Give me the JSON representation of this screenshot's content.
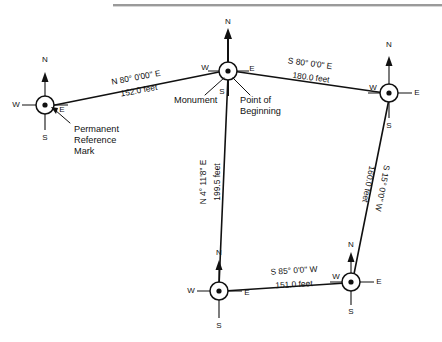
{
  "diagram": {
    "top_rule_color": "#9a9a9a",
    "line_color": "#111111",
    "background": "#ffffff"
  },
  "compass_labels": {
    "north": "N",
    "south": "S",
    "east": "E",
    "west": "W"
  },
  "stations": [
    {
      "id": "prm",
      "name": "permanent-reference-mark",
      "x": 45,
      "y": 105,
      "n": "N",
      "s": "S",
      "e": "E",
      "w": "W"
    },
    {
      "id": "pob",
      "name": "point-of-beginning-monument",
      "x": 228,
      "y": 71,
      "n": "N",
      "s": "S",
      "e": "E",
      "w": "W"
    },
    {
      "id": "ne",
      "name": "northeast-corner",
      "x": 389,
      "y": 93,
      "n": "N",
      "s": "S",
      "e": "E",
      "w": "W"
    },
    {
      "id": "se",
      "name": "southeast-corner",
      "x": 351,
      "y": 282,
      "n": "N",
      "s": "S",
      "e": "E",
      "w": "W"
    },
    {
      "id": "sw",
      "name": "southwest-corner",
      "x": 219,
      "y": 291,
      "n": "N",
      "s": "S",
      "e": "E",
      "w": "W"
    }
  ],
  "courses": [
    {
      "id": "prm-to-pob",
      "name": "course-north-80-east",
      "bearing": "N 80° 0'00\" E",
      "distance": "152.0 feet",
      "bearing_x": 136,
      "bearing_y": 78,
      "distance_x": 139,
      "distance_y": 91,
      "rotation": -10.5
    },
    {
      "id": "pob-to-ne",
      "name": "course-south-80-east",
      "bearing": "S 80° 0'0\" E",
      "distance": "180.0 feet",
      "bearing_x": 310,
      "bearing_y": 64,
      "distance_x": 311,
      "distance_y": 78,
      "rotation": 7.5
    },
    {
      "id": "ne-to-se",
      "name": "course-south-15-west",
      "bearing": "S 15° 0'0\" W",
      "distance": "160.0 feet",
      "bearing_x": 382,
      "bearing_y": 188,
      "distance_x": 368,
      "distance_y": 184,
      "rotation": 101
    },
    {
      "id": "se-to-sw",
      "name": "course-south-85-west",
      "bearing": "S 85° 0'0\" W",
      "distance": "151.0 feet",
      "bearing_x": 294,
      "bearing_y": 271,
      "distance_x": 294,
      "distance_y": 285,
      "rotation": -3.5
    },
    {
      "id": "sw-to-pob",
      "name": "course-north-4-east",
      "bearing": "N 4° 11'8\" E",
      "distance": "199.5 feet",
      "bearing_x": 204,
      "bearing_y": 182,
      "distance_x": 218,
      "distance_y": 182,
      "rotation": -90
    }
  ],
  "annotations": [
    {
      "id": "permanent-reference-mark",
      "name": "annotation-permanent-reference-mark",
      "lines": [
        "Permanent",
        "Reference",
        "Mark"
      ],
      "x": 74,
      "y": 130,
      "line_height": 11
    },
    {
      "id": "monument",
      "name": "annotation-monument",
      "lines": [
        "Monument"
      ],
      "x": 174,
      "y": 101,
      "line_height": 11
    },
    {
      "id": "point-of-beginning",
      "name": "annotation-point-of-beginning",
      "lines": [
        "Point of",
        "Beginning"
      ],
      "x": 240,
      "y": 101,
      "line_height": 11
    }
  ]
}
